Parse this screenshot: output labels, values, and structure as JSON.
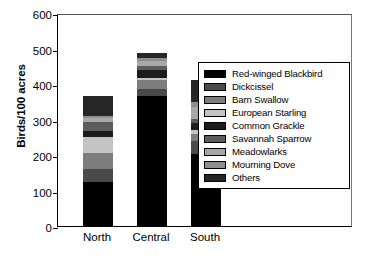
{
  "chart_data": {
    "type": "bar",
    "subtype": "stacked-bar",
    "title": "",
    "xlabel": "",
    "ylabel": "Birds/100 acres",
    "categories": [
      "North",
      "Central",
      "South"
    ],
    "ylim": [
      0,
      600
    ],
    "yticks": [
      0,
      100,
      200,
      300,
      400,
      500,
      600
    ],
    "ytick_labels": [
      "0",
      "100",
      "200",
      "300",
      "400",
      "500",
      "600"
    ],
    "grid": false,
    "legend_position": "right-inside",
    "series": [
      {
        "name": "Red-winged Blackbird",
        "color": "#000000",
        "values": [
          125,
          365,
          202
        ]
      },
      {
        "name": "Dickcissel",
        "color": "#4a4a4a",
        "values": [
          35,
          20,
          38
        ]
      },
      {
        "name": "Barn Swallow",
        "color": "#7d7d7d",
        "values": [
          45,
          25,
          18
        ]
      },
      {
        "name": "European Starling",
        "color": "#c4c4c4",
        "values": [
          45,
          8,
          12
        ]
      },
      {
        "name": "Common Grackle",
        "color": "#1c1c1c",
        "values": [
          18,
          22,
          20
        ]
      },
      {
        "name": "Savannah Sparrow",
        "color": "#5c5c5c",
        "values": [
          25,
          12,
          12
        ]
      },
      {
        "name": "Meadowlarks",
        "color": "#a8a8a8",
        "values": [
          10,
          12,
          32
        ]
      },
      {
        "name": "Mourning Dove",
        "color": "#8e8e8e",
        "values": [
          8,
          10,
          15
        ]
      },
      {
        "name": "Others",
        "color": "#262626",
        "values": [
          55,
          14,
          62
        ]
      }
    ],
    "totals": [
      366,
      488,
      411
    ]
  }
}
